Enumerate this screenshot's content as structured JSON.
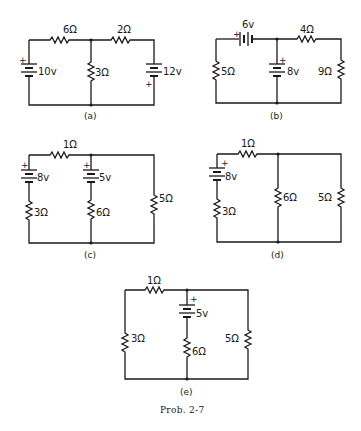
{
  "figure_caption": "Prob. 2-7",
  "circuits": {
    "a": {
      "label": "(a)",
      "r_top_left": "6Ω",
      "r_top_right": "2Ω",
      "r_middle": "3Ω",
      "v_left": "10v",
      "v_right": "12v",
      "plus": "+"
    },
    "b": {
      "label": "(b)",
      "v_top": "6v",
      "r_top_right": "4Ω",
      "r_left": "5Ω",
      "v_middle": "8v",
      "r_right": "9Ω",
      "plus": "+"
    },
    "c": {
      "label": "(c)",
      "r_top": "1Ω",
      "v_left": "8v",
      "r_left": "3Ω",
      "v_middle": "5v",
      "r_middle": "6Ω",
      "r_right": "5Ω",
      "plus": "+"
    },
    "d": {
      "label": "(d)",
      "r_top": "1Ω",
      "v_left": "8v",
      "r_left": "3Ω",
      "r_middle": "6Ω",
      "r_right": "5Ω",
      "plus": "+"
    },
    "e": {
      "label": "(e)",
      "r_top": "1Ω",
      "r_left": "3Ω",
      "v_middle": "5v",
      "r_middle": "6Ω",
      "r_right": "5Ω",
      "plus": "+"
    }
  }
}
